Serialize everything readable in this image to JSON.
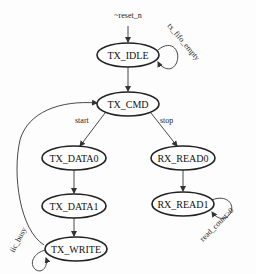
{
  "diagram": {
    "type": "state-machine",
    "nodes": [
      {
        "id": "TX_IDLE",
        "label": "TX_IDLE"
      },
      {
        "id": "TX_CMD",
        "label": "TX_CMD"
      },
      {
        "id": "TX_DATA0",
        "label": "TX_DATA0"
      },
      {
        "id": "TX_DATA1",
        "label": "TX_DATA1"
      },
      {
        "id": "TX_WRITE",
        "label": "TX_WRITE"
      },
      {
        "id": "RX_READ0",
        "label": "RX_READ0"
      },
      {
        "id": "RX_READ1",
        "label": "RX_READ1"
      }
    ],
    "edges": [
      {
        "from": "reset",
        "to": "TX_IDLE",
        "label": "~reset_n"
      },
      {
        "from": "TX_IDLE",
        "to": "TX_IDLE",
        "label": "tx_fifo_empty"
      },
      {
        "from": "TX_IDLE",
        "to": "TX_CMD",
        "label": ""
      },
      {
        "from": "TX_CMD",
        "to": "TX_DATA0",
        "label": "start"
      },
      {
        "from": "TX_CMD",
        "to": "RX_READ0",
        "label": "stop"
      },
      {
        "from": "TX_DATA0",
        "to": "TX_DATA1",
        "label": ""
      },
      {
        "from": "TX_DATA1",
        "to": "TX_WRITE",
        "label": ""
      },
      {
        "from": "TX_WRITE",
        "to": "TX_WRITE",
        "label": "iic_busy"
      },
      {
        "from": "TX_WRITE",
        "to": "TX_CMD",
        "label": ""
      },
      {
        "from": "RX_READ0",
        "to": "RX_READ1",
        "label": ""
      },
      {
        "from": "RX_READ1",
        "to": "RX_READ1",
        "label": "read_count>0"
      }
    ]
  }
}
